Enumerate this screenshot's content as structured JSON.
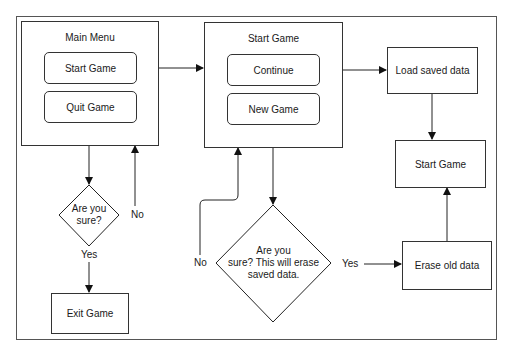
{
  "diagram": {
    "type": "flowchart",
    "main_menu": {
      "title": "Main Menu",
      "buttons": [
        "Start Game",
        "Quit Game"
      ]
    },
    "start_game_menu": {
      "title": "Start Game",
      "buttons": [
        "Continue",
        "New Game"
      ]
    },
    "boxes": {
      "load_saved_data": "Load saved data",
      "start_game": "Start Game",
      "erase_old_data": "Erase old data",
      "exit_game": "Exit Game"
    },
    "decisions": {
      "quit_confirm": {
        "line1": "Are you",
        "line2": "sure?"
      },
      "new_game_confirm": {
        "line1": "Are you",
        "line2": "sure? This will erase",
        "line3": "saved data."
      }
    },
    "edge_labels": {
      "quit_no": "No",
      "quit_yes": "Yes",
      "new_no": "No",
      "new_yes": "Yes"
    },
    "edges": [
      {
        "from": "Start Game (Main Menu)",
        "to": "Start Game menu"
      },
      {
        "from": "Quit Game",
        "to": "Are you sure?"
      },
      {
        "from": "Are you sure?",
        "to": "Main Menu",
        "label": "No"
      },
      {
        "from": "Are you sure?",
        "to": "Exit Game",
        "label": "Yes"
      },
      {
        "from": "Continue",
        "to": "Load saved data"
      },
      {
        "from": "Load saved data",
        "to": "Start Game"
      },
      {
        "from": "New Game",
        "to": "Are you sure? This will erase saved data."
      },
      {
        "from": "Are you sure? This will erase saved data.",
        "to": "Start Game menu",
        "label": "No"
      },
      {
        "from": "Are you sure? This will erase saved data.",
        "to": "Erase old data",
        "label": "Yes"
      },
      {
        "from": "Erase old data",
        "to": "Start Game"
      }
    ]
  }
}
